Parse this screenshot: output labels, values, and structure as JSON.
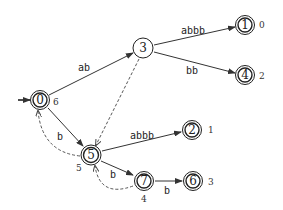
{
  "diagram": {
    "type": "automaton",
    "initial_state": "0",
    "nodes": [
      {
        "id": "0",
        "label": "0",
        "output": "6",
        "accepting": true
      },
      {
        "id": "3",
        "label": "3",
        "output": "",
        "accepting": false
      },
      {
        "id": "1",
        "label": "1",
        "output": "0",
        "accepting": true
      },
      {
        "id": "4",
        "label": "4",
        "output": "2",
        "accepting": true
      },
      {
        "id": "5",
        "label": "5",
        "output": "5",
        "accepting": true
      },
      {
        "id": "2",
        "label": "2",
        "output": "1",
        "accepting": true
      },
      {
        "id": "7",
        "label": "7",
        "output": "4",
        "accepting": true
      },
      {
        "id": "6",
        "label": "6",
        "output": "3",
        "accepting": true
      }
    ],
    "edges": [
      {
        "from": "0",
        "to": "3",
        "label": "ab",
        "style": "solid"
      },
      {
        "from": "3",
        "to": "1",
        "label": "abbb",
        "style": "solid"
      },
      {
        "from": "3",
        "to": "4",
        "label": "bb",
        "style": "solid"
      },
      {
        "from": "0",
        "to": "5",
        "label": "b",
        "style": "solid"
      },
      {
        "from": "5",
        "to": "2",
        "label": "abbb",
        "style": "solid"
      },
      {
        "from": "5",
        "to": "7",
        "label": "b",
        "style": "solid"
      },
      {
        "from": "7",
        "to": "6",
        "label": "b",
        "style": "solid"
      },
      {
        "from": "3",
        "to": "5",
        "label": "",
        "style": "dashed"
      },
      {
        "from": "5",
        "to": "0",
        "label": "",
        "style": "dashed"
      },
      {
        "from": "7",
        "to": "5",
        "label": "",
        "style": "dashed"
      }
    ]
  }
}
